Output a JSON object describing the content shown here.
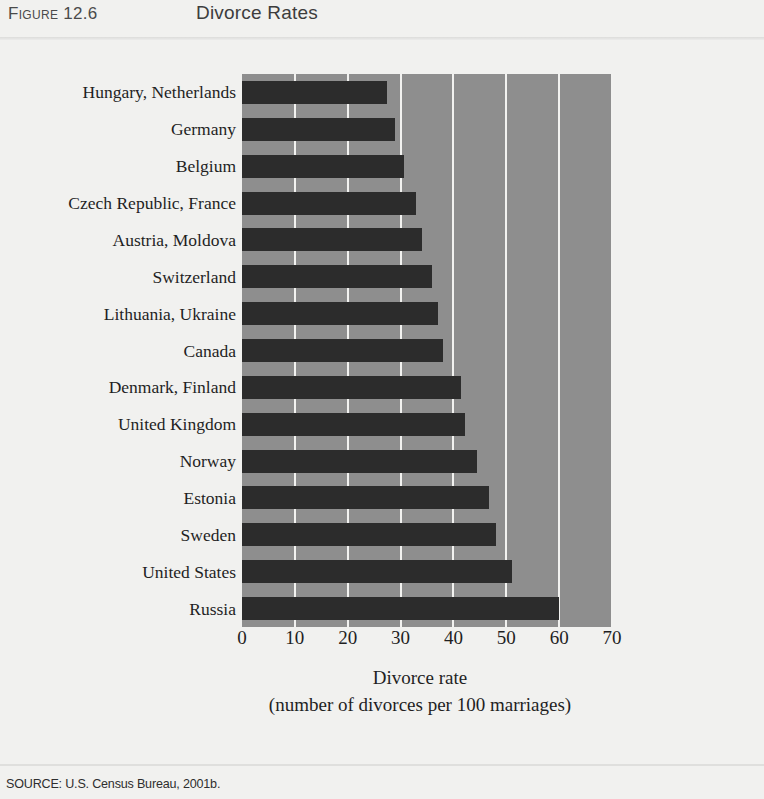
{
  "header": {
    "figure_number": "Figure 12.6",
    "title": "Divorce Rates"
  },
  "source": {
    "note": "SOURCE: U.S. Census Bureau, 2001b."
  },
  "colors": {
    "page_background": "#f1f1ef",
    "plot_background": "#8e8e8e",
    "bar": "#2c2c2c",
    "gridline": "#f2f2f0",
    "text": "#1f1f1f"
  },
  "chart_data": {
    "type": "bar",
    "orientation": "horizontal",
    "title": "Divorce Rates",
    "xlabel": "Divorce rate",
    "xlabel_sub": "(number of divorces per 100 marriages)",
    "ylabel": "",
    "xlim": [
      0,
      70
    ],
    "xticks": [
      0,
      10,
      20,
      30,
      40,
      50,
      60,
      70
    ],
    "xtick_labels": [
      "0",
      "10",
      "20",
      "30",
      "40",
      "50",
      "60",
      "70"
    ],
    "grid": true,
    "grid_axis": "x",
    "legend": false,
    "categories": [
      "Hungary, Netherlands",
      "Germany",
      "Belgium",
      "Czech Republic, France",
      "Austria, Moldova",
      "Switzerland",
      "Lithuania, Ukraine",
      "Canada",
      "Denmark, Finland",
      "United Kingdom",
      "Norway",
      "Estonia",
      "Sweden",
      "United States",
      "Russia"
    ],
    "values": [
      27.4,
      29,
      30.6,
      33,
      34,
      36,
      37,
      38,
      41.5,
      42.2,
      44.4,
      46.7,
      48,
      51,
      60
    ]
  }
}
